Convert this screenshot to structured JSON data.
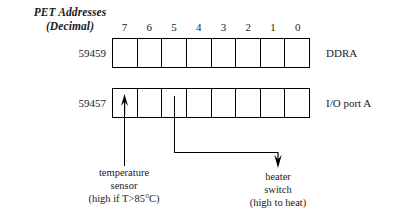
{
  "figure": {
    "heading_line1": "PET Addresses",
    "heading_line2": "(Decimal)"
  },
  "bit_ruler": {
    "labels": [
      "7",
      "6",
      "5",
      "4",
      "3",
      "2",
      "1",
      "0"
    ]
  },
  "registers": [
    {
      "address": "59459",
      "name": "DDRA",
      "cells": [
        "",
        "",
        "",
        "",
        "",
        "",
        "",
        ""
      ]
    },
    {
      "address": "59457",
      "name": "I/O port A",
      "cells": [
        "",
        "",
        "",
        "",
        "",
        "",
        "",
        ""
      ]
    }
  ],
  "annotations": [
    {
      "id": "temperature-sensor",
      "bit": "7",
      "line1": "temperature",
      "line2": "sensor",
      "line3": "(high if T>85°C)",
      "direction": "in"
    },
    {
      "id": "heater-switch",
      "bit": "4",
      "line1": "heater",
      "line2": "switch",
      "line3": "(high to heat)",
      "direction": "out"
    }
  ],
  "colors": {
    "ink": "#000000",
    "paper": "#ffffff"
  }
}
